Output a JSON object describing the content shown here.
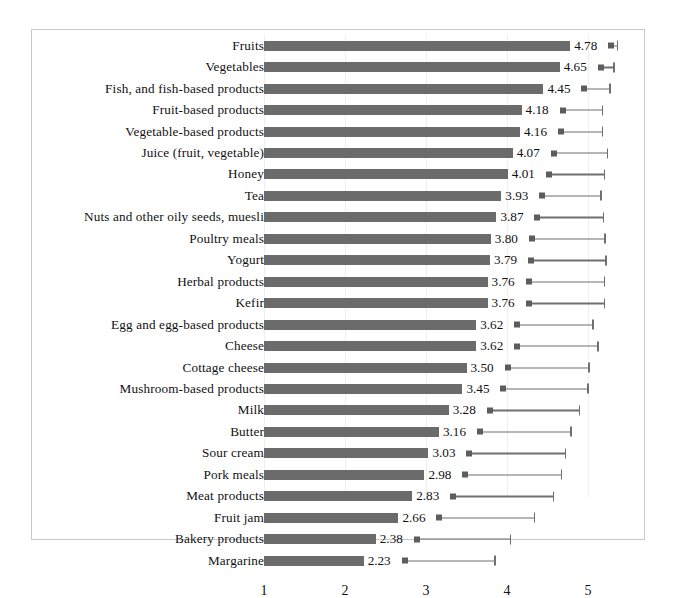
{
  "chart_data": {
    "type": "bar",
    "orientation": "horizontal",
    "title": "",
    "xlabel": "",
    "ylabel": "",
    "xlim": [
      0.55,
      5.5
    ],
    "xticks": [
      1,
      2,
      3,
      4,
      5
    ],
    "xtick_labels": [
      "1",
      "2",
      "3",
      "4",
      "5"
    ],
    "grid": true,
    "legend": null,
    "bar_color": "#6b6b6b",
    "errorbar_color": "#6f6f6f",
    "bar_baseline": 1,
    "categories": [
      "Fruits",
      "Vegetables",
      "Fish, and fish-based products",
      "Fruit-based products",
      "Vegetable-based products",
      "Juice (fruit, vegetable)",
      "Honey",
      "Tea",
      "Nuts and other oily seeds, muesli",
      "Poultry meals",
      "Yogurt",
      "Herbal products",
      "Kefir",
      "Egg and egg-based products",
      "Cheese",
      "Cottage cheese",
      "Mushroom-based products",
      "Milk",
      "Butter",
      "Sour cream",
      "Pork meals",
      "Meat products",
      "Fruit jam",
      "Bakery products",
      "Margarine"
    ],
    "values": [
      4.78,
      4.65,
      4.45,
      4.18,
      4.16,
      4.07,
      4.01,
      3.93,
      3.87,
      3.8,
      3.79,
      3.76,
      3.76,
      3.62,
      3.62,
      3.5,
      3.45,
      3.28,
      3.16,
      3.03,
      2.98,
      2.83,
      2.66,
      2.38,
      2.23
    ],
    "value_labels": [
      "4.78",
      "4.65",
      "4.45",
      "4.18",
      "4.16",
      "4.07",
      "4.01",
      "3.93",
      "3.87",
      "3.80",
      "3.79",
      "3.76",
      "3.76",
      "3.62",
      "3.62",
      "3.50",
      "3.45",
      "3.28",
      "3.16",
      "3.03",
      "2.98",
      "2.83",
      "2.66",
      "2.38",
      "2.23"
    ],
    "error_upper": [
      5.31,
      5.33,
      5.28,
      5.19,
      5.19,
      5.25,
      5.21,
      5.17,
      5.2,
      5.22,
      5.23,
      5.21,
      5.21,
      5.07,
      5.13,
      5.02,
      5.01,
      4.9,
      4.8,
      4.73,
      4.68,
      4.58,
      4.35,
      4.05,
      3.86
    ]
  }
}
